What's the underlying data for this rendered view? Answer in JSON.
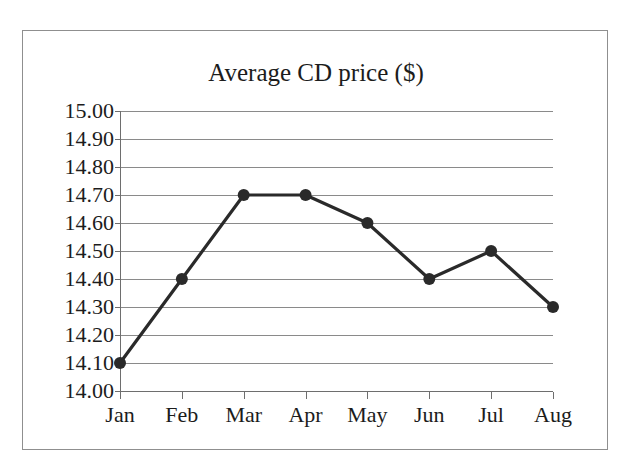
{
  "chart_data": {
    "type": "line",
    "title": "Average CD price ($)",
    "xlabel": "",
    "ylabel": "",
    "categories": [
      "Jan",
      "Feb",
      "Mar",
      "Apr",
      "May",
      "Jun",
      "Jul",
      "Aug"
    ],
    "values": [
      14.1,
      14.4,
      14.7,
      14.7,
      14.6,
      14.4,
      14.5,
      14.3
    ],
    "series": [
      {
        "name": "Average CD price ($)",
        "values": [
          14.1,
          14.4,
          14.7,
          14.7,
          14.6,
          14.4,
          14.5,
          14.3
        ]
      }
    ],
    "ylim": [
      14.0,
      15.0
    ],
    "ytick_step": 0.1,
    "ytick_labels": [
      "15.00",
      "14.90",
      "14.80",
      "14.70",
      "14.60",
      "14.50",
      "14.40",
      "14.30",
      "14.20",
      "14.10",
      "14.00"
    ],
    "ytick_values": [
      15.0,
      14.9,
      14.8,
      14.7,
      14.6,
      14.5,
      14.4,
      14.3,
      14.2,
      14.1,
      14.0
    ],
    "grid": true,
    "grid_axis": "y",
    "legend": false,
    "legend_position": "none",
    "marker": "filled-circle",
    "line_color": "#2a2a2a",
    "marker_color": "#2a2a2a",
    "grid_color": "#8a8a8a",
    "axis_color": "#6e6e6e",
    "text_color": "#1c1c1c",
    "background_color": "#ffffff",
    "border_color": "#8f8f8f",
    "annotations": []
  }
}
